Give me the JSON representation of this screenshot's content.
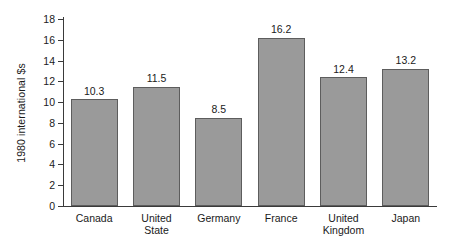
{
  "chart_data": {
    "type": "bar",
    "title": "",
    "xlabel": "",
    "ylabel": "1980 international $s",
    "ylim": [
      0,
      18
    ],
    "yticks": [
      0,
      2,
      4,
      6,
      8,
      10,
      12,
      14,
      16,
      18
    ],
    "grid": false,
    "legend": false,
    "categories": [
      "Canada",
      "United\nState",
      "Germany",
      "France",
      "United\nKingdom",
      "Japan"
    ],
    "values": [
      10.3,
      11.5,
      8.5,
      16.2,
      12.4,
      13.2
    ],
    "value_labels": [
      "10.3",
      "11.5",
      "8.5",
      "16.2",
      "12.4",
      "13.2"
    ],
    "tick_labels": [
      "0",
      "2",
      "4",
      "6",
      "8",
      "10",
      "12",
      "14",
      "16",
      "18"
    ],
    "colors": {
      "bar_fill": "#9a9a9a",
      "bar_border": "#5d5d5d",
      "axis": "#3a3a3a",
      "text": "#1a1a1a",
      "background": "#ffffff"
    }
  }
}
